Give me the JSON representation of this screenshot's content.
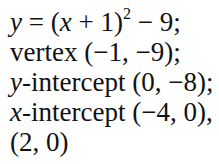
{
  "lines": [
    {
      "name": "equation",
      "var": "y",
      "text": " = (",
      "var2": "x",
      "text2": " + 1)",
      "exp": "2",
      "text3": " − 9;"
    },
    {
      "name": "vertex",
      "text": "vertex (−1, −9);"
    },
    {
      "name": "y-intercept",
      "var": "y",
      "text": "-intercept (0, −8);"
    },
    {
      "name": "x-intercept",
      "var": "x",
      "text": "-intercept (−4, 0),"
    },
    {
      "name": "x-intercept-2",
      "text": "(2, 0)"
    }
  ]
}
